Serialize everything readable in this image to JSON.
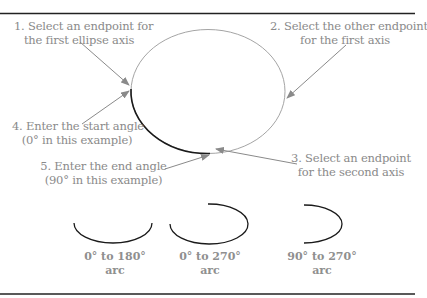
{
  "diagram": {
    "steps": [
      {
        "id": 1,
        "line1": "1. Select an endpoint for",
        "line2": "the first ellipse axis"
      },
      {
        "id": 2,
        "line1": "2. Select the other endpoint",
        "line2": "for the first axis"
      },
      {
        "id": 3,
        "line1": "3. Select an endpoint",
        "line2": "for the second axis"
      },
      {
        "id": 4,
        "line1": "4. Enter the start angle",
        "line2": "(0° in this example)"
      },
      {
        "id": 5,
        "line1": "5. Enter the end angle",
        "line2": "(90° in this example)"
      }
    ],
    "examples": [
      {
        "line1": "0° to 180°",
        "line2": "arc",
        "start_angle": 0,
        "end_angle": 180
      },
      {
        "line1": "0° to 270°",
        "line2": "arc",
        "start_angle": 0,
        "end_angle": 270
      },
      {
        "line1": "90° to 270°",
        "line2": "arc",
        "start_angle": 90,
        "end_angle": 270
      }
    ],
    "colors": {
      "ellipse": "#9a9a9a",
      "arc": "#1a1a1a",
      "arrow": "#8a8a8a",
      "text": "#8a8a8a",
      "rule": "#222222"
    }
  }
}
